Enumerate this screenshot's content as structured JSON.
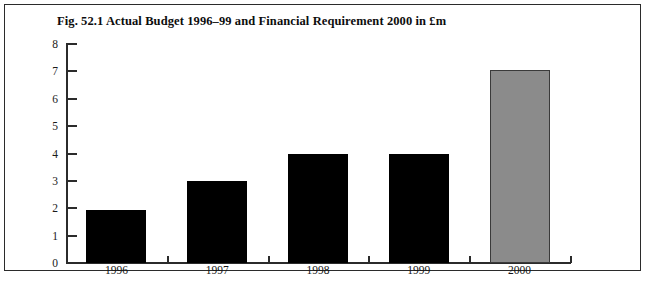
{
  "figure": {
    "title": "Fig. 52.1 Actual Budget 1996–99 and Financial Requirement 2000 in £m",
    "border_color": "#2b2b2b",
    "background": "#ffffff"
  },
  "chart_data": {
    "type": "bar",
    "title": "Fig. 52.1 Actual Budget 1996–99 and Financial Requirement 2000 in £m",
    "xlabel": "",
    "ylabel": "",
    "categories": [
      "1996",
      "1997",
      "1998",
      "1999",
      "2000"
    ],
    "values": [
      1.95,
      3.0,
      4.0,
      4.0,
      7.05
    ],
    "bar_colors": [
      "#000000",
      "#000000",
      "#000000",
      "#000000",
      "#8b8b8b"
    ],
    "bar_series_names": [
      "Actual Budget",
      "Actual Budget",
      "Actual Budget",
      "Actual Budget",
      "Financial Requirement"
    ],
    "ylim": [
      0,
      8
    ],
    "yticks": [
      0,
      1,
      2,
      3,
      4,
      5,
      6,
      7,
      8
    ],
    "ytick_labels": [
      "0",
      "1",
      "2",
      "3",
      "4",
      "5",
      "6",
      "7",
      "8"
    ],
    "grid": false,
    "legend": "none",
    "units": "£m"
  }
}
